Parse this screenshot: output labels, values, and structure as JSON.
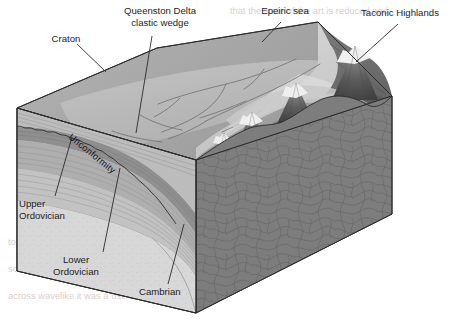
{
  "figure": {
    "type": "geologic-block-diagram",
    "background_color": "#ffffff",
    "width": 456,
    "height": 322
  },
  "labels": {
    "craton": "Craton",
    "queenston_line1": "Queenston Delta",
    "queenston_line2": "clastic wedge",
    "epeiric_sea": "Epeiric sea",
    "taconic_highlands": "Taconic Highlands",
    "unconformity": "Unconformity",
    "upper_ord_line1": "Upper",
    "upper_ord_line2": "Ordovician",
    "lower_ord_line1": "Lower",
    "lower_ord_line2": "Ordovician",
    "cambrian": "Cambrian"
  },
  "units": [
    {
      "name": "Cambrian",
      "color": "#d6d6d6",
      "position": "lowest sedimentary wedge"
    },
    {
      "name": "Lower Ordovician",
      "color": "#b9b9b9",
      "position": "middle carbonate layers"
    },
    {
      "name": "Upper Ordovician",
      "color": "#9e9e9e",
      "position": "above unconformity"
    },
    {
      "name": "Queenston Delta clastic wedge",
      "color": "#8c8c8c",
      "position": "wedge thinning westward"
    },
    {
      "name": "Metamorphic basement",
      "color": "#7d7d7d",
      "position": "right block face, swirled texture"
    }
  ],
  "surface": {
    "craton_top_color": "#a9a9a9",
    "delta_plain_color": "#bdbdbd",
    "epeiric_sea_color": "#cfcfcf",
    "highlands_color": "#6f6f6f",
    "volcano_count": 4,
    "volcano_peak_color": "#f2f2f2"
  },
  "colors": {
    "outline": "#2b2b2b",
    "label_text": "#1d1d1d",
    "bleed_text": "#d9cfcd"
  },
  "bleed_through": {
    "line1": "that the state of the art is reduced and",
    "line2": "and marine",
    "line3": "to make it new and the was at",
    "line4": "so barrier full was a new region",
    "line5": "across wavelike it was a use has a side"
  }
}
